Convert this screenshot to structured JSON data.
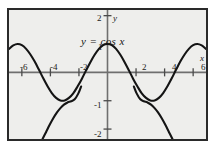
{
  "figure": {
    "background_color": "#eeeeec",
    "frame_color": "#2a2a2a",
    "curve_color": "#141414",
    "axis_color": "#6f6f6f"
  },
  "labels": {
    "curve_label": "y = cos x",
    "x_axis_name": "x",
    "y_axis_name": "y"
  },
  "axes": {
    "x_ticks": [
      {
        "value": -6,
        "label": "-6"
      },
      {
        "value": -4,
        "label": "-4"
      },
      {
        "value": -2,
        "label": "-2"
      },
      {
        "value": 2,
        "label": "2"
      },
      {
        "value": 4,
        "label": "4"
      },
      {
        "value": 6,
        "label": "6"
      }
    ],
    "y_ticks": [
      {
        "value": 2,
        "label": "2"
      },
      {
        "value": 1,
        "label": "1"
      },
      {
        "value": -1,
        "label": "-1"
      },
      {
        "value": -2,
        "label": "-2"
      }
    ]
  },
  "chart_data": {
    "type": "line",
    "title": "",
    "xlabel": "x",
    "ylabel": "y",
    "xlim": [
      -6.9,
      6.9
    ],
    "ylim": [
      -2.35,
      2.2
    ],
    "grid": false,
    "legend": "none",
    "annotations": [
      {
        "text": "y = cos x",
        "x": 2.2,
        "y": 0.75
      }
    ],
    "series": [
      {
        "name": "y = cos x",
        "x": [
          -6.9,
          -6.6,
          -6.3,
          -6.0,
          -5.7,
          -5.4,
          -5.1,
          -4.8,
          -4.5,
          -4.2,
          -3.9,
          -3.6,
          -3.3,
          -3.0,
          -2.7,
          -2.4,
          -2.1,
          -1.8,
          -1.5,
          -1.2,
          -0.9,
          -0.6,
          -0.3,
          0.0,
          0.3,
          0.6,
          0.9,
          1.2,
          1.5,
          1.8,
          2.1,
          2.4,
          2.7,
          3.0,
          3.3,
          3.6,
          3.9,
          4.2,
          4.5,
          4.8,
          5.1,
          5.4,
          5.7,
          6.0,
          6.3,
          6.6,
          6.9
        ],
        "y": [
          0.83,
          0.95,
          1.0,
          0.96,
          0.83,
          0.63,
          0.38,
          0.09,
          -0.21,
          -0.49,
          -0.73,
          -0.9,
          -0.99,
          -0.99,
          -0.9,
          -0.74,
          -0.5,
          -0.23,
          0.07,
          0.36,
          0.62,
          0.83,
          0.96,
          1.0,
          0.96,
          0.83,
          0.62,
          0.36,
          0.07,
          -0.23,
          -0.5,
          -0.74,
          -0.9,
          -0.99,
          -0.99,
          -0.9,
          -0.73,
          -0.49,
          -0.21,
          0.09,
          0.38,
          0.63,
          0.83,
          0.96,
          1.0,
          0.95,
          0.83
        ]
      },
      {
        "name": "secondary-curve",
        "x": [
          -4.55,
          -4.3,
          -4.05,
          -3.8,
          -3.55,
          -3.3,
          -3.05,
          -2.8,
          -2.55,
          -2.3,
          -2.05,
          -1.85
        ],
        "y": [
          -2.35,
          -2.1,
          -1.85,
          -1.62,
          -1.42,
          -1.26,
          -1.14,
          -1.06,
          -1.02,
          -0.95,
          -0.75,
          -0.5
        ]
      },
      {
        "name": "secondary-curve-mirror",
        "x": [
          4.55,
          4.3,
          4.05,
          3.8,
          3.55,
          3.3,
          3.05,
          2.8,
          2.55,
          2.3,
          2.05,
          1.85
        ],
        "y": [
          -2.35,
          -2.1,
          -1.85,
          -1.62,
          -1.42,
          -1.26,
          -1.14,
          -1.06,
          -1.02,
          -0.95,
          -0.75,
          -0.5
        ]
      }
    ]
  }
}
